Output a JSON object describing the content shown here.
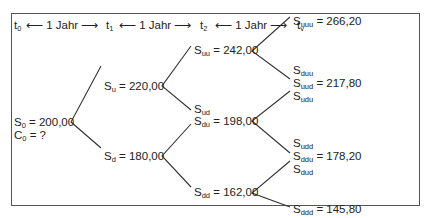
{
  "timeline": {
    "points": [
      {
        "sym": "t",
        "sub": "0"
      },
      {
        "sym": "t",
        "sub": "1"
      },
      {
        "sym": "t",
        "sub": "2"
      },
      {
        "sym": "t",
        "sub": "v"
      }
    ],
    "interval_label": "1 Jahr",
    "left_arrow": "⟵",
    "right_arrow": "⟶"
  },
  "tree": {
    "root": {
      "s_sym": "S",
      "s_sub": "0",
      "s_value": "= 200,00",
      "c_sym": "C",
      "c_sub": "0",
      "c_value": "=  ?"
    },
    "level1": [
      {
        "sub": "u",
        "value": "= 220,00"
      },
      {
        "sub": "d",
        "value": "= 180,00"
      }
    ],
    "level2": [
      {
        "aliases": [],
        "sub": "uu",
        "value": "= 242,00"
      },
      {
        "aliases": [
          "ud"
        ],
        "sub": "du",
        "value": "= 198,00"
      },
      {
        "aliases": [],
        "sub": "dd",
        "value": "= 162,00"
      }
    ],
    "level3": [
      {
        "above": [],
        "sub": "uuu",
        "value": "= 266,20",
        "below": []
      },
      {
        "above": [
          "duu"
        ],
        "sub": "uud",
        "value": "= 217,80",
        "below": [
          "udu"
        ]
      },
      {
        "above": [
          "udd"
        ],
        "sub": "ddu",
        "value": "= 178,20",
        "below": [
          "dud"
        ]
      },
      {
        "above": [],
        "sub": "ddd",
        "value": "= 145,80",
        "below": []
      }
    ],
    "symbol": "S"
  }
}
